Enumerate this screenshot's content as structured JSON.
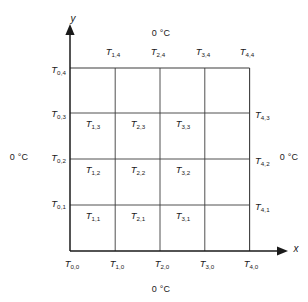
{
  "figure": {
    "title_present": false,
    "axis_labels": {
      "x": "x",
      "y": "y"
    },
    "boundary_temperature": "0 °C",
    "boundary_labels": {
      "top": "0 °C",
      "bottom": "0 °C",
      "left": "0 °C",
      "right": "0 °C"
    },
    "colors": {
      "background": "#ffffff",
      "axis": "#1a1a1a",
      "gridline": "#3c3c3c",
      "text": "#1a1a1a"
    }
  },
  "grid": {
    "columns": 4,
    "rows": 4,
    "nodes_x": [
      "0",
      "1",
      "2",
      "3",
      "4"
    ],
    "nodes_y": [
      "0",
      "1",
      "2",
      "3",
      "4"
    ]
  },
  "nodes": {
    "interior": [
      {
        "label": "T",
        "i": "1",
        "j": "3",
        "sub": "1,3"
      },
      {
        "label": "T",
        "i": "2",
        "j": "3",
        "sub": "2,3"
      },
      {
        "label": "T",
        "i": "3",
        "j": "3",
        "sub": "3,3"
      },
      {
        "label": "T",
        "i": "1",
        "j": "2",
        "sub": "1,2"
      },
      {
        "label": "T",
        "i": "2",
        "j": "2",
        "sub": "2,2"
      },
      {
        "label": "T",
        "i": "3",
        "j": "2",
        "sub": "3,2"
      },
      {
        "label": "T",
        "i": "1",
        "j": "1",
        "sub": "1,1"
      },
      {
        "label": "T",
        "i": "2",
        "j": "1",
        "sub": "2,1"
      },
      {
        "label": "T",
        "i": "3",
        "j": "1",
        "sub": "3,1"
      }
    ],
    "top": [
      {
        "label": "T",
        "sub": "1,4"
      },
      {
        "label": "T",
        "sub": "2,4"
      },
      {
        "label": "T",
        "sub": "3,4"
      },
      {
        "label": "T",
        "sub": "4,4"
      }
    ],
    "left": [
      {
        "label": "T",
        "sub": "0,4"
      },
      {
        "label": "T",
        "sub": "0,3"
      },
      {
        "label": "T",
        "sub": "0,2"
      },
      {
        "label": "T",
        "sub": "0,1"
      }
    ],
    "right": [
      {
        "label": "T",
        "sub": "4,3"
      },
      {
        "label": "T",
        "sub": "4,2"
      },
      {
        "label": "T",
        "sub": "4,1"
      }
    ],
    "bottom": [
      {
        "label": "T",
        "sub": "0,0"
      },
      {
        "label": "T",
        "sub": "1,0"
      },
      {
        "label": "T",
        "sub": "2,0"
      },
      {
        "label": "T",
        "sub": "3,0"
      },
      {
        "label": "T",
        "sub": "4,0"
      }
    ]
  }
}
